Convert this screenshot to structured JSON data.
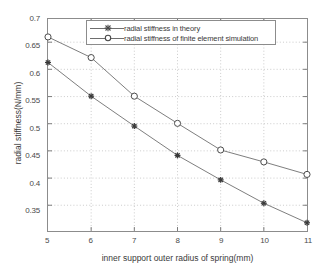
{
  "chart_data": {
    "type": "line",
    "title": "",
    "xlabel": "inner support outer radius of spring(mm)",
    "ylabel": "radial stiffness(N/mm)",
    "x": [
      5,
      6,
      7,
      8,
      9,
      10,
      11
    ],
    "xlim": [
      5,
      11
    ],
    "ylim": [
      0.325,
      0.7
    ],
    "xticks": [
      "5",
      "6",
      "7",
      "8",
      "9",
      "10",
      "11"
    ],
    "yticks": [
      "0.35",
      "0.4",
      "0.45",
      "0.5",
      "0.55",
      "0.6",
      "0.65",
      "0.7"
    ],
    "ytick_values": [
      0.35,
      0.4,
      0.45,
      0.5,
      0.55,
      0.6,
      0.65,
      0.7
    ],
    "grid": true,
    "grid_style": "dotted",
    "legend_position": "top-center",
    "series": [
      {
        "name": "radial stiffness in theory",
        "marker": "star",
        "values": [
          0.62,
          0.558,
          0.503,
          0.449,
          0.404,
          0.361,
          0.325
        ]
      },
      {
        "name": "radial stiffness of finite element simulation",
        "marker": "open-circle",
        "values": [
          0.667,
          0.629,
          0.558,
          0.508,
          0.459,
          0.437,
          0.414
        ]
      }
    ],
    "colors": {
      "line": "#6e6e6e",
      "axis": "#8c8c8c",
      "grid": "#b8b8b8",
      "text": "#3a3a3a",
      "background": "#ffffff"
    }
  }
}
